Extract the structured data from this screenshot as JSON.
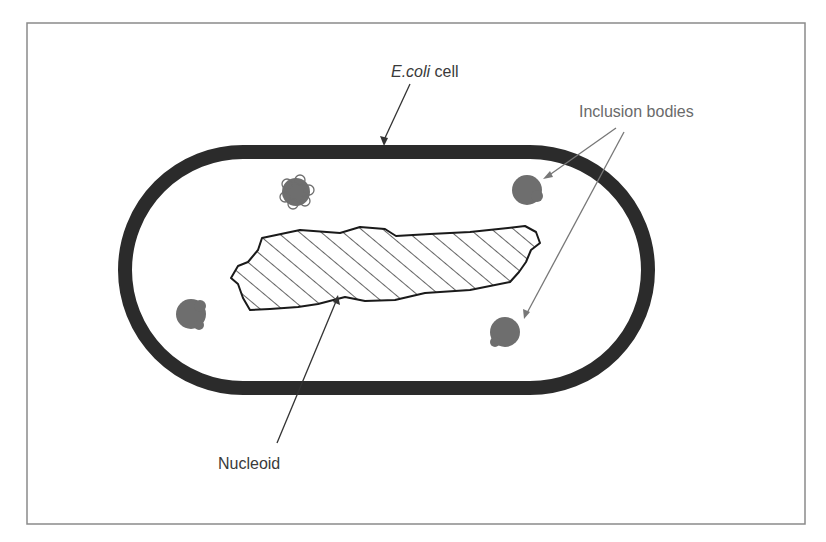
{
  "diagram": {
    "labels": {
      "cell": {
        "italic": "E.coli",
        "rest": " cell"
      },
      "inclusion_bodies": "Inclusion bodies",
      "nucleoid": "Nucleoid"
    },
    "colors": {
      "frame": "#8a8a8a",
      "cell_wall": "#2b2b2b",
      "inclusion_body": "#6e6e6e",
      "leader_line": "#444444",
      "leader_gray": "#777777",
      "hatch": "#222222"
    },
    "components": [
      {
        "name": "cell-wall",
        "description": "thick rounded capsule outline"
      },
      {
        "name": "nucleoid",
        "description": "irregular hatched region"
      },
      {
        "name": "inclusion-body",
        "count": 4
      }
    ]
  }
}
